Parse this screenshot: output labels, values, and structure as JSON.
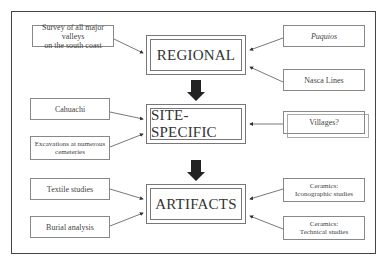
{
  "diagram": {
    "levels": [
      {
        "id": "regional",
        "label": "REGIONAL"
      },
      {
        "id": "site-specific",
        "label": "SITE-SPECIFIC"
      },
      {
        "id": "artifacts",
        "label": "ARTIFACTS"
      }
    ],
    "inputs": {
      "regional_left": [
        "Survey of all major valleys",
        "on the south coast"
      ],
      "regional_right_top": "Puquios",
      "regional_right_bottom": "Nasca Lines",
      "site_left_top": "Cahuachi",
      "site_left_bottom": [
        "Excavations at numerous",
        "cemeteries"
      ],
      "site_right": "Villages?",
      "artifacts_left_top": "Textile studies",
      "artifacts_left_bottom": "Burial analysis",
      "artifacts_right_top": [
        "Ceramics:",
        "Iconographic studies"
      ],
      "artifacts_right_bottom": [
        "Ceramics:",
        "Technical studies"
      ]
    }
  }
}
